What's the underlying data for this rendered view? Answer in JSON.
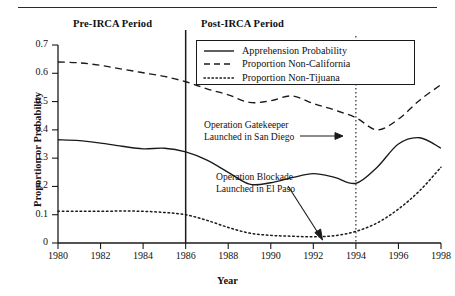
{
  "figure": {
    "period_labels": {
      "pre": "Pre-IRCA Period",
      "post": "Post-IRCA Period"
    },
    "axes": {
      "ylabel": "Proportion or Probability",
      "xlabel": "Year",
      "yticks": [
        "0",
        "0.1",
        "0.2",
        "0.3",
        "0.4",
        "0.5",
        "0.6",
        "0.7"
      ],
      "xticks": [
        "1980",
        "1982",
        "1984",
        "1986",
        "1988",
        "1990",
        "1992",
        "1994",
        "1996",
        "1998"
      ]
    },
    "legend": {
      "items": [
        {
          "label": "Apprehension Probability",
          "style": "solid"
        },
        {
          "label": "Proportion Non-California",
          "style": "dashed"
        },
        {
          "label": "Proportion Non-Tijuana",
          "style": "dotted"
        }
      ]
    },
    "annotations": [
      {
        "id": "gatekeeper",
        "line1": "Operation Gatekeeper",
        "line2": "Launched in San Diego"
      },
      {
        "id": "blockade",
        "line1": "Operation Blockade",
        "line2": "Launched in El Paso"
      }
    ],
    "markers": [
      {
        "name": "irca-divider",
        "year": 1986,
        "style": "solid"
      },
      {
        "name": "gatekeeper-divider",
        "year": 1994,
        "style": "dotted"
      }
    ],
    "colors": {
      "ink": "#1a1a1a",
      "background": "#ffffff"
    }
  },
  "chart_data": {
    "type": "line",
    "title": "",
    "xlabel": "Year",
    "ylabel": "Proportion or Probability",
    "xlim": [
      1980,
      1998
    ],
    "ylim": [
      0,
      0.7
    ],
    "grid": false,
    "legend_position": "top-right-inset",
    "x": [
      1980,
      1981,
      1982,
      1983,
      1984,
      1985,
      1986,
      1987,
      1988,
      1989,
      1990,
      1991,
      1992,
      1993,
      1994,
      1995,
      1996,
      1997,
      1998
    ],
    "series": [
      {
        "name": "Apprehension Probability",
        "style": "solid",
        "values": [
          0.365,
          0.362,
          0.353,
          0.342,
          0.333,
          0.335,
          0.322,
          0.293,
          0.25,
          0.208,
          0.213,
          0.231,
          0.245,
          0.232,
          0.211,
          0.268,
          0.35,
          0.372,
          0.335
        ]
      },
      {
        "name": "Proportion Non-California",
        "style": "dashed",
        "values": [
          0.64,
          0.637,
          0.628,
          0.615,
          0.602,
          0.589,
          0.57,
          0.545,
          0.524,
          0.497,
          0.503,
          0.52,
          0.493,
          0.47,
          0.443,
          0.4,
          0.438,
          0.505,
          0.56
        ]
      },
      {
        "name": "Proportion Non-Tijuana",
        "style": "dotted",
        "values": [
          0.112,
          0.112,
          0.112,
          0.113,
          0.112,
          0.108,
          0.1,
          0.08,
          0.055,
          0.035,
          0.027,
          0.024,
          0.022,
          0.026,
          0.041,
          0.071,
          0.12,
          0.185,
          0.268
        ]
      }
    ],
    "annotations": [
      {
        "text": "Operation Gatekeeper Launched in San Diego",
        "points_to_year": 1994
      },
      {
        "text": "Operation Blockade Launched in El Paso",
        "points_to_year": 1993
      }
    ],
    "vlines": [
      {
        "year": 1986,
        "style": "solid",
        "label": "Pre-IRCA Period / Post-IRCA Period boundary"
      },
      {
        "year": 1994,
        "style": "dotted",
        "label": "Operation Gatekeeper"
      }
    ]
  }
}
